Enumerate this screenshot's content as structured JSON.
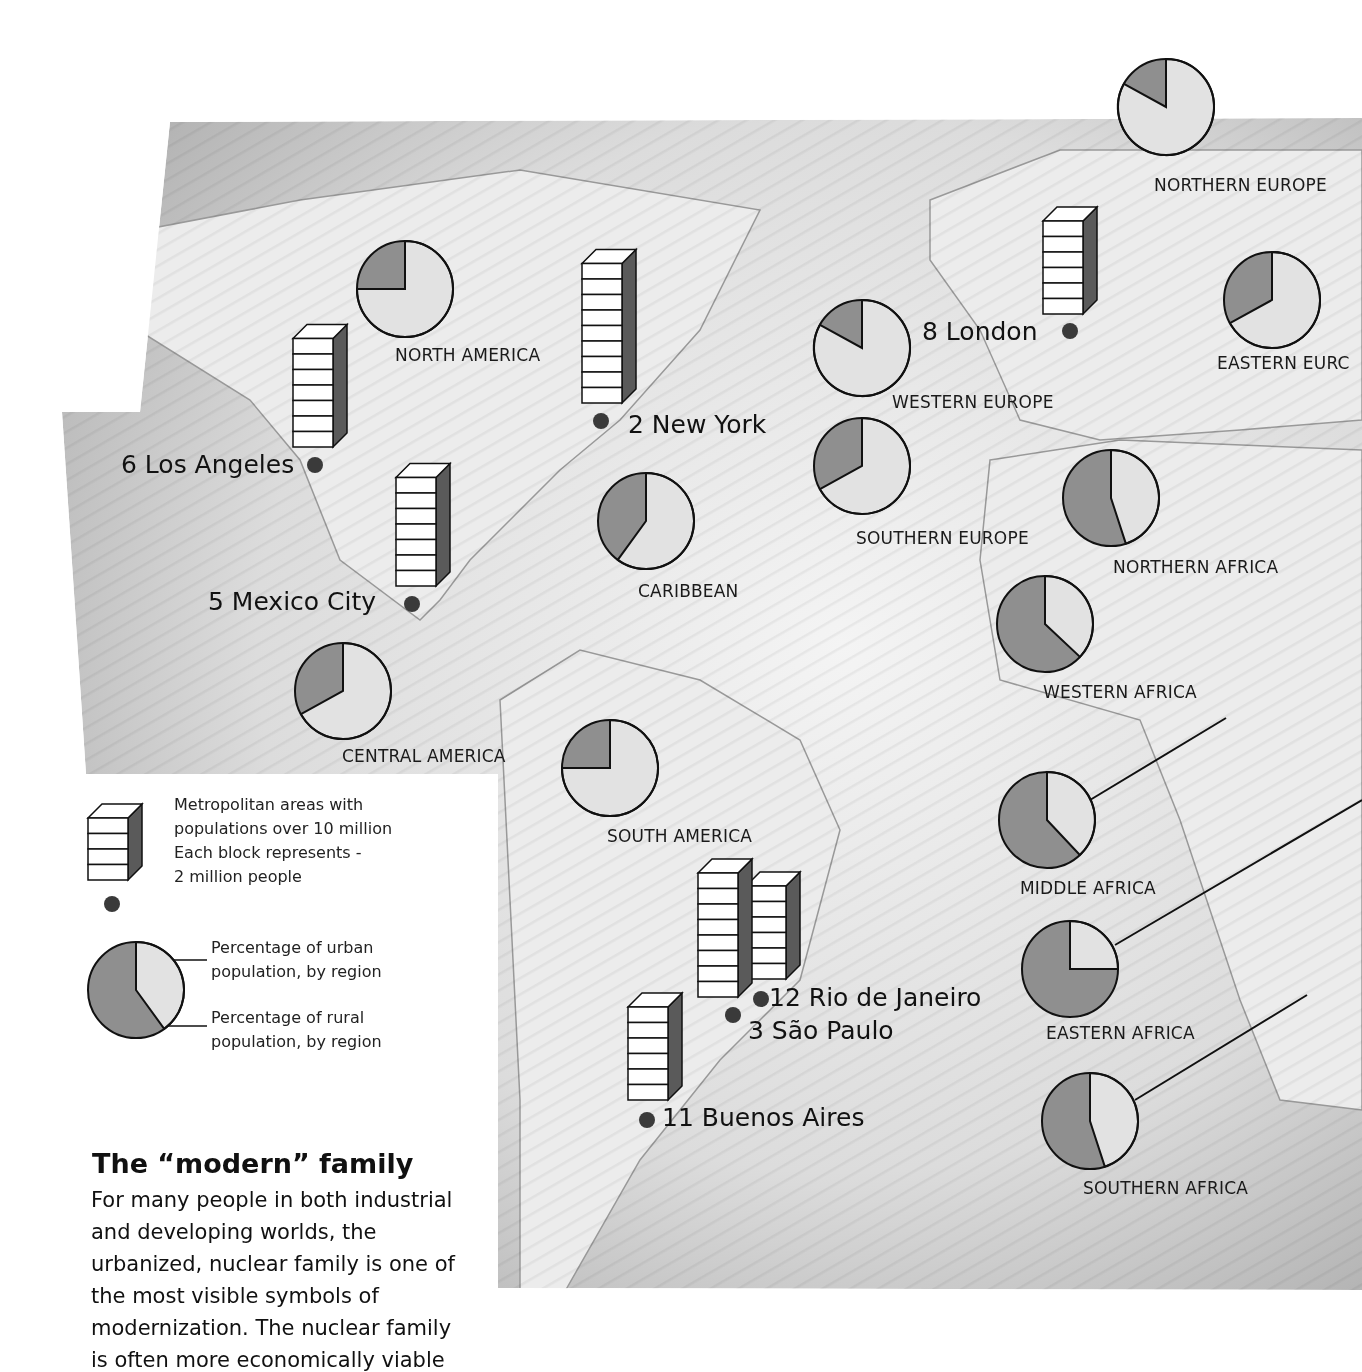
{
  "legend": {
    "metro_line1": "Metropolitan areas with",
    "metro_line2": "populations over 10 million",
    "metro_line3": "Each block represents -",
    "metro_line4": "2 million people",
    "urban_line1": "Percentage of urban",
    "urban_line2": "population, by region",
    "rural_line1": "Percentage of rural",
    "rural_line2": "population, by region"
  },
  "article": {
    "heading": "The “modern” family",
    "body": "For many people in both industrial and developing worlds, the urbanized, nuclear family is one of the most visible symbols of modernization. The nuclear family is often more economically viable"
  },
  "cities": [
    {
      "label": "2 New York",
      "rank": 2,
      "blocks": 9
    },
    {
      "label": "6 Los Angeles",
      "rank": 6,
      "blocks": 7
    },
    {
      "label": "5 Mexico City",
      "rank": 5,
      "blocks": 7
    },
    {
      "label": "8 London",
      "rank": 8,
      "blocks": 6
    },
    {
      "label": "12 Rio de Janeiro",
      "rank": 12,
      "blocks": 6
    },
    {
      "label": "3 São Paulo",
      "rank": 3,
      "blocks": 8
    },
    {
      "label": "11 Buenos Aires",
      "rank": 11,
      "blocks": 6
    }
  ],
  "regions": [
    {
      "name": "NORTH AMERICA",
      "urban_pct": 75
    },
    {
      "name": "NORTHERN EUROPE",
      "urban_pct": 83
    },
    {
      "name": "EASTERN EURC",
      "urban_pct": 67
    },
    {
      "name": "WESTERN EUROPE",
      "urban_pct": 83
    },
    {
      "name": "SOUTHERN EUROPE",
      "urban_pct": 67
    },
    {
      "name": "CARIBBEAN",
      "urban_pct": 60
    },
    {
      "name": "CENTRAL AMERICA",
      "urban_pct": 67
    },
    {
      "name": "SOUTH AMERICA",
      "urban_pct": 75
    },
    {
      "name": "NORTHERN AFRICA",
      "urban_pct": 45
    },
    {
      "name": "WESTERN AFRICA",
      "urban_pct": 37
    },
    {
      "name": "MIDDLE AFRICA",
      "urban_pct": 38
    },
    {
      "name": "EASTERN AFRICA",
      "urban_pct": 25
    },
    {
      "name": "SOUTHERN AFRICA",
      "urban_pct": 45
    }
  ],
  "colors": {
    "rural": "#8f8f8f",
    "urban": "#e2e2e2",
    "bar_side": "#5a5a5a",
    "dot": "#3a3a3a"
  }
}
